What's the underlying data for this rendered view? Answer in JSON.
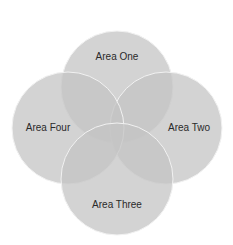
{
  "diagram": {
    "type": "four-circle-venn",
    "fill_color": "#c4c4c4",
    "stroke_color": "#f2f2f2",
    "text_color": "#2a2a2a",
    "areas": [
      {
        "id": "one",
        "label": "Area One",
        "cx": 117,
        "cy": 87,
        "r": 56,
        "label_x": 117,
        "label_y": 60
      },
      {
        "id": "two",
        "label": "Area Two",
        "cx": 166,
        "cy": 128,
        "r": 56,
        "label_x": 189,
        "label_y": 131
      },
      {
        "id": "three",
        "label": "Area Three",
        "cx": 117,
        "cy": 179,
        "r": 56,
        "label_x": 117,
        "label_y": 208
      },
      {
        "id": "four",
        "label": "Area Four",
        "cx": 68,
        "cy": 128,
        "r": 56,
        "label_x": 48,
        "label_y": 131
      }
    ]
  }
}
